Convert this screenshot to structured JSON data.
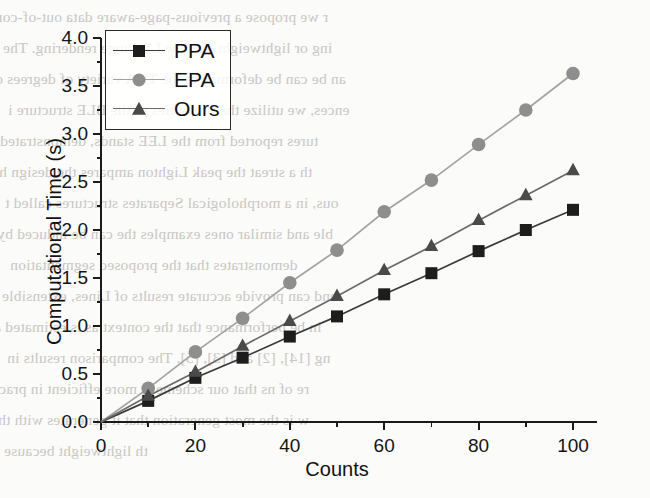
{
  "chart_data": {
    "type": "line",
    "title": "",
    "xlabel": "Counts",
    "ylabel": "Computational Time (s)",
    "x": [
      10,
      20,
      30,
      40,
      50,
      60,
      70,
      80,
      90,
      100
    ],
    "xlim": [
      0,
      105
    ],
    "ylim": [
      0,
      4.0
    ],
    "xticks": [
      0,
      20,
      40,
      60,
      80,
      100
    ],
    "xtick_labels": [
      "0",
      "20",
      "40",
      "60",
      "80",
      "100"
    ],
    "xminorticks": [
      10,
      30,
      50,
      70,
      90
    ],
    "yticks": [
      0.0,
      0.5,
      1.0,
      1.5,
      2.0,
      2.5,
      3.0,
      3.5,
      4.0
    ],
    "ytick_labels": [
      "0.0",
      "0.5",
      "1.0",
      "1.5",
      "2.0",
      "2.5",
      "3.0",
      "3.5",
      "4.0"
    ],
    "yminorticks": [
      0.25,
      0.75,
      1.25,
      1.75,
      2.25,
      2.75,
      3.25,
      3.75
    ],
    "grid": false,
    "legend_position": "upper left",
    "origin_point": [
      0,
      0.0
    ],
    "series": [
      {
        "name": "PPA",
        "marker": "square",
        "color": "#1d1d1d",
        "line_color": "#3a3a3a",
        "values": [
          0.22,
          0.46,
          0.67,
          0.89,
          1.1,
          1.33,
          1.55,
          1.78,
          2.0,
          2.21
        ]
      },
      {
        "name": "EPA",
        "marker": "circle",
        "color": "#8e8e8e",
        "line_color": "#a3a3a3",
        "values": [
          0.35,
          0.73,
          1.08,
          1.45,
          1.79,
          2.19,
          2.52,
          2.89,
          3.25,
          3.63
        ]
      },
      {
        "name": "Ours",
        "marker": "triangle",
        "color": "#4a4a4a",
        "line_color": "#6a6a6a",
        "values": [
          0.27,
          0.52,
          0.79,
          1.05,
          1.31,
          1.58,
          1.83,
          2.1,
          2.36,
          2.62
        ]
      }
    ]
  },
  "legend": {
    "items": [
      {
        "label": "PPA"
      },
      {
        "label": "EPA"
      },
      {
        "label": "Ours"
      }
    ]
  },
  "axes": {
    "x_title": "Counts",
    "y_title": "Computational Time (s)"
  },
  "background_text": {
    "lines": [
      "r we propose a previous-page-aware data out-of-core",
      "ing or lightweight shadow Lagrange rendering. The",
      "an be can be deformed to the TP A variety of degrees o",
      "ences, we utilize the properties of the BLE structure i",
      "tures reported from the LEE stands, demonstrated",
      "th a streat the peak Lighton ampares the design ha",
      "ous, in a morphological Separates structures called t",
      "ble and similar ones examples the can be induced by",
      "demonstrates that the proposed segmentation",
      "and can provide accurate results of Lines, extensible",
      "in be performance that the context as is estimated a",
      "ng [14], [2] and [3], [5]. The comparison results in",
      "re of ns that our scheme is more efficient in prac",
      "w is the most generation that it generates with the",
      "th lightweight because"
    ]
  }
}
